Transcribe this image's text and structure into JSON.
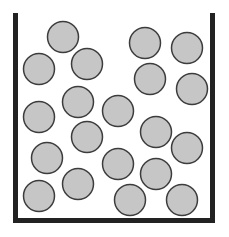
{
  "diagram": {
    "title": "",
    "canvas": {
      "width": 229,
      "height": 237,
      "background": "#ffffff"
    },
    "container": {
      "color": "#222222",
      "wall_thickness": 5,
      "left_wall": {
        "x": 13,
        "y_top": 13,
        "y_bottom": 223
      },
      "right_wall": {
        "x": 210,
        "y_top": 13,
        "y_bottom": 223
      },
      "floor": {
        "y": 218,
        "x_left": 13,
        "x_right": 215
      }
    },
    "particle_style": {
      "radius": 15.5,
      "fill": "#c6c6c6",
      "stroke": "#3c3c3c",
      "stroke_width": 1.5
    },
    "particle_count": 20,
    "particles": [
      {
        "cx": 63,
        "cy": 37
      },
      {
        "cx": 39,
        "cy": 69
      },
      {
        "cx": 87,
        "cy": 64
      },
      {
        "cx": 145,
        "cy": 43
      },
      {
        "cx": 187,
        "cy": 48
      },
      {
        "cx": 150,
        "cy": 79
      },
      {
        "cx": 192,
        "cy": 89
      },
      {
        "cx": 78,
        "cy": 102
      },
      {
        "cx": 39,
        "cy": 117
      },
      {
        "cx": 118,
        "cy": 111
      },
      {
        "cx": 87,
        "cy": 137
      },
      {
        "cx": 156,
        "cy": 132
      },
      {
        "cx": 187,
        "cy": 148
      },
      {
        "cx": 47,
        "cy": 158
      },
      {
        "cx": 118,
        "cy": 164
      },
      {
        "cx": 78,
        "cy": 184
      },
      {
        "cx": 156,
        "cy": 174
      },
      {
        "cx": 39,
        "cy": 196
      },
      {
        "cx": 130,
        "cy": 200
      },
      {
        "cx": 182,
        "cy": 200
      }
    ]
  }
}
